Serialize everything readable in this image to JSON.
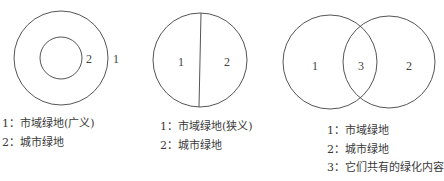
{
  "colors": {
    "stroke": "#555555",
    "text": "#3a3a3a",
    "background": "#ffffff"
  },
  "diagrams": [
    {
      "name": "concentric",
      "labels": {
        "inner": "2",
        "outer": "1"
      },
      "legend": [
        "1：市域绿地(广义)",
        "2：城市绿地"
      ]
    },
    {
      "name": "split",
      "labels": {
        "left": "1",
        "right": "2"
      },
      "legend": [
        "1：市域绿地(狭义)",
        "2：城市绿地"
      ]
    },
    {
      "name": "venn",
      "labels": {
        "left": "1",
        "middle": "3",
        "right": "2"
      },
      "legend": [
        "1：市域绿地",
        "2：城市绿地",
        "3：它们共有的绿化内容"
      ]
    }
  ]
}
